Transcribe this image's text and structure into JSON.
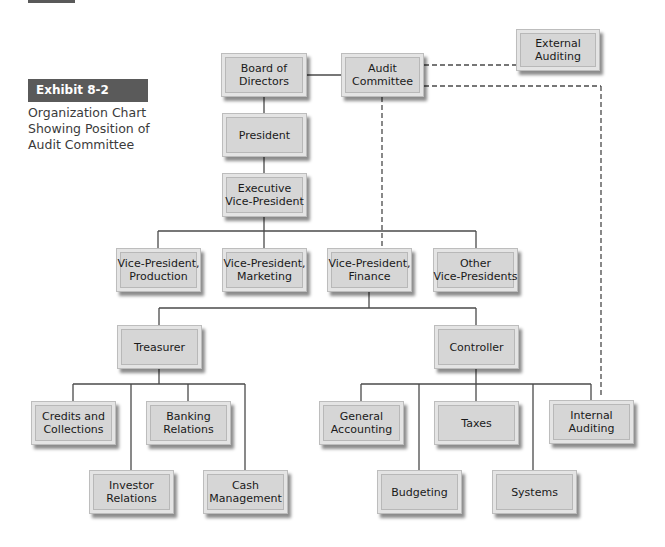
{
  "exhibit": {
    "tag": "Exhibit 8-2",
    "caption_lines": [
      "Organization Chart",
      "Showing Position of",
      "Audit Committee"
    ]
  },
  "nodes": {
    "board": {
      "lines": [
        "Board of",
        "Directors"
      ]
    },
    "audit": {
      "lines": [
        "Audit",
        "Committee"
      ]
    },
    "external": {
      "lines": [
        "External",
        "Auditing"
      ]
    },
    "president": {
      "lines": [
        "President"
      ]
    },
    "exec_vp": {
      "lines": [
        "Executive",
        "Vice-President"
      ]
    },
    "vp_production": {
      "lines": [
        "Vice-President,",
        "Production"
      ]
    },
    "vp_marketing": {
      "lines": [
        "Vice-President,",
        "Marketing"
      ]
    },
    "vp_finance": {
      "lines": [
        "Vice-President,",
        "Finance"
      ]
    },
    "other_vps": {
      "lines": [
        "Other",
        "Vice-Presidents"
      ]
    },
    "treasurer": {
      "lines": [
        "Treasurer"
      ]
    },
    "controller": {
      "lines": [
        "Controller"
      ]
    },
    "credits": {
      "lines": [
        "Credits and",
        "Collections"
      ]
    },
    "banking": {
      "lines": [
        "Banking",
        "Relations"
      ]
    },
    "investor": {
      "lines": [
        "Investor",
        "Relations"
      ]
    },
    "cash": {
      "lines": [
        "Cash",
        "Management"
      ]
    },
    "general_accounting": {
      "lines": [
        "General",
        "Accounting"
      ]
    },
    "taxes": {
      "lines": [
        "Taxes"
      ]
    },
    "internal": {
      "lines": [
        "Internal",
        "Auditing"
      ]
    },
    "budgeting": {
      "lines": [
        "Budgeting"
      ]
    },
    "systems": {
      "lines": [
        "Systems"
      ]
    }
  },
  "colors": {
    "box_fill": "#d6d6d6",
    "line": "#4a4a4a",
    "tag_bg": "#5a5a5a"
  }
}
